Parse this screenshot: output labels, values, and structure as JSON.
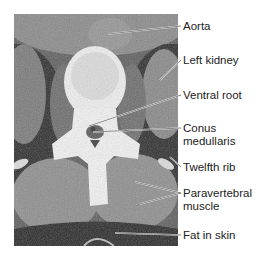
{
  "figure": {
    "type": "axial CT scan, lumbar level (conus medullaris)",
    "labels": [
      {
        "id": "aorta",
        "text": "Aorta",
        "lines": [
          "Aorta"
        ]
      },
      {
        "id": "left-kidney",
        "text": "Left kidney",
        "lines": [
          "Left kidney"
        ]
      },
      {
        "id": "ventral-root",
        "text": "Ventral root",
        "lines": [
          "Ventral root"
        ]
      },
      {
        "id": "conus-medullaris",
        "text": "Conus medullaris",
        "lines": [
          "Conus",
          "medullaris"
        ]
      },
      {
        "id": "twelfth-rib",
        "text": "Twelfth rib",
        "lines": [
          "Twelfth rib"
        ]
      },
      {
        "id": "paravertebral-muscle",
        "text": "Paravertebral muscle",
        "lines": [
          "Paravertebral",
          "muscle"
        ]
      },
      {
        "id": "fat-in-skin",
        "text": "Fat in skin",
        "lines": [
          "Fat in skin"
        ]
      }
    ]
  }
}
